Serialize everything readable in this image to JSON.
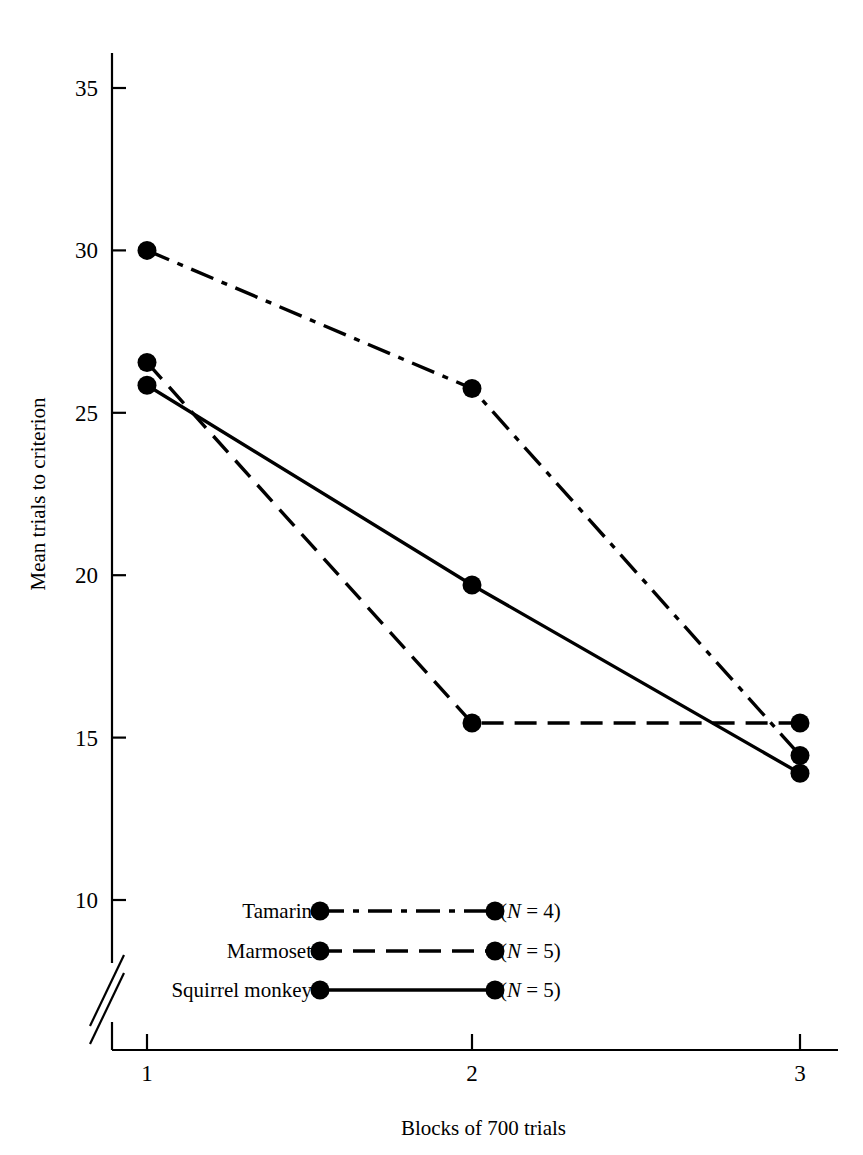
{
  "figure": {
    "background_color": "#ffffff",
    "ink_color": "#000000"
  },
  "axes": {
    "y_label": "Mean trials to criterion",
    "x_label": "Blocks of 700 trials",
    "y_ticks": [
      "10",
      "15",
      "20",
      "25",
      "30",
      "35"
    ],
    "x_ticks": [
      "1",
      "2",
      "3"
    ],
    "y_axis_break": true
  },
  "legend": {
    "rows": [
      {
        "label": "Tamarin",
        "n_text": "(N = 4)",
        "n_prefix": "(",
        "n_italic": "N",
        "n_suffix": " = 4)",
        "style": "dashdot"
      },
      {
        "label": "Marmoset",
        "n_text": "(N = 5)",
        "n_prefix": "(",
        "n_italic": "N",
        "n_suffix": " = 5)",
        "style": "dashed"
      },
      {
        "label": "Squirrel monkey",
        "n_text": "(N = 5)",
        "n_prefix": "(",
        "n_italic": "N",
        "n_suffix": " = 5)",
        "style": "solid"
      }
    ]
  },
  "chart_data": {
    "type": "line",
    "title": "",
    "xlabel": "Blocks of 700 trials",
    "ylabel": "Mean trials to criterion",
    "categories": [
      1,
      2,
      3
    ],
    "x_tick_labels": [
      "1",
      "2",
      "3"
    ],
    "y_tick_labels": [
      "10",
      "15",
      "20",
      "25",
      "30",
      "35"
    ],
    "xlim": [
      1,
      3
    ],
    "ylim": [
      10,
      35
    ],
    "grid": false,
    "legend_position": "inside-lower-center",
    "axis_break_y": "below 10",
    "series": [
      {
        "name": "Tamarin",
        "n": 4,
        "line_style": "dash-dot",
        "marker": "filled-circle",
        "values": [
          30.0,
          25.75,
          14.45
        ]
      },
      {
        "name": "Marmoset",
        "n": 5,
        "line_style": "dashed",
        "marker": "filled-circle",
        "values": [
          26.55,
          15.45,
          15.45
        ]
      },
      {
        "name": "Squirrel monkey",
        "n": 5,
        "line_style": "solid",
        "marker": "filled-circle",
        "values": [
          25.85,
          19.7,
          13.9
        ]
      }
    ]
  }
}
